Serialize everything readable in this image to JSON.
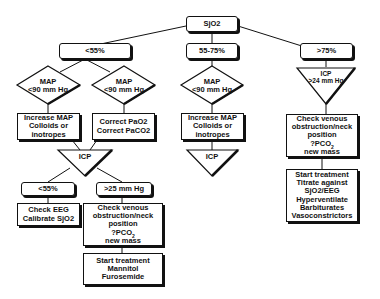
{
  "root": {
    "label": "SjO2"
  },
  "branches": {
    "low": {
      "label": "<55%"
    },
    "mid": {
      "label": "55-75%"
    },
    "high": {
      "label": ">75%"
    }
  },
  "low_branch": {
    "diamond_left": {
      "line1": "MAP",
      "line2": "<90 mm Hg"
    },
    "diamond_right": {
      "line1": "MAP",
      "line2": "<90 mm Hg"
    },
    "box_left": {
      "lines": [
        "Increase MAP",
        "Colloids or",
        "inotropes"
      ]
    },
    "box_right": {
      "lines": [
        "Correct PaO2",
        "Correct PaCO2"
      ]
    },
    "icp": {
      "label": "ICP"
    },
    "icp_low": {
      "label": "<55%"
    },
    "icp_high": {
      "label": ">25 mm Hg"
    },
    "check_eeg": {
      "lines": [
        "Check EEG",
        "Calibrate SjO2"
      ]
    },
    "check_venous": {
      "lines": [
        "Check venous",
        "obstruction/neck",
        "position",
        "?PCO",
        "new mass"
      ],
      "sub": "2"
    },
    "treatment": {
      "lines": [
        "Start treatment",
        "Mannitol",
        "Furosemide"
      ]
    }
  },
  "mid_branch": {
    "diamond": {
      "line1": "MAP",
      "line2": "<90 mm Hg"
    },
    "box": {
      "lines": [
        "Increase MAP",
        "Colloids or",
        "inotropes"
      ]
    },
    "icp": {
      "label": "ICP"
    }
  },
  "high_branch": {
    "icp": {
      "line1": "ICP",
      "line2": ">24 mm Hg"
    },
    "check_venous": {
      "lines": [
        "Check venous",
        "obstruction/neck",
        "position",
        "?PCO",
        "new mass"
      ],
      "sub": "2"
    },
    "treatment": {
      "lines": [
        "Start treatment",
        "Titrate against",
        "SjO2/EEG",
        "Hyperventilate",
        "Barbiturates",
        "Vasoconstrictors"
      ]
    }
  }
}
